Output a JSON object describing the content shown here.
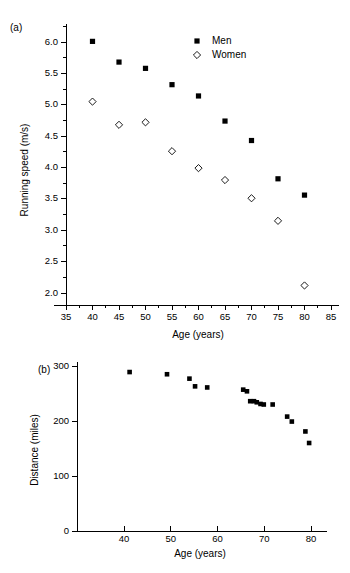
{
  "figure": {
    "panel_a_label": "(a)",
    "panel_b_label": "(b)"
  },
  "legend": {
    "men_label": "Men",
    "women_label": "Women"
  },
  "chart_data": [
    {
      "type": "scatter",
      "panel": "(a)",
      "title": "",
      "xlabel": "Age (years)",
      "ylabel": "Running speed (m/s)",
      "xlim": [
        35,
        85
      ],
      "ylim": [
        2.0,
        6.0
      ],
      "xticks": [
        35,
        40,
        45,
        50,
        55,
        60,
        65,
        70,
        75,
        80,
        85
      ],
      "yticks": [
        2.0,
        2.5,
        3.0,
        3.5,
        4.0,
        4.5,
        5.0,
        5.5,
        6.0
      ],
      "xtick_labels": [
        "35",
        "40",
        "45",
        "50",
        "55",
        "60",
        "65",
        "70",
        "75",
        "80",
        "85"
      ],
      "ytick_labels": [
        "2.0",
        "2.5",
        "3.0",
        "3.5",
        "4.0",
        "4.5",
        "5.0",
        "5.5",
        "6.0"
      ],
      "minor_ticks": true,
      "grid": false,
      "legend_position": "top-right",
      "series": [
        {
          "name": "Men",
          "marker": "filled-square",
          "x": [
            40,
            45,
            50,
            55,
            60,
            65,
            70,
            75,
            80
          ],
          "y": [
            6.01,
            5.68,
            5.58,
            5.32,
            5.14,
            4.74,
            4.43,
            3.82,
            3.56
          ]
        },
        {
          "name": "Women",
          "marker": "open-diamond",
          "x": [
            40,
            45,
            50,
            55,
            60,
            65,
            70,
            75,
            80
          ],
          "y": [
            5.05,
            4.68,
            4.72,
            4.26,
            3.99,
            3.8,
            3.51,
            3.15,
            2.12
          ]
        }
      ]
    },
    {
      "type": "scatter",
      "panel": "(b)",
      "title": "",
      "xlabel": "Age (years)",
      "ylabel": "Distance (miles)",
      "xlim": [
        35,
        82
      ],
      "ylim": [
        0,
        300
      ],
      "xticks": [
        40,
        50,
        60,
        70,
        80
      ],
      "yticks": [
        0,
        100,
        200,
        300
      ],
      "xtick_labels": [
        "40",
        "50",
        "60",
        "70",
        "80"
      ],
      "ytick_labels": [
        "0",
        "100",
        "200",
        "300"
      ],
      "minor_ticks": false,
      "grid": false,
      "legend_position": "none",
      "series": [
        {
          "name": "Distance",
          "marker": "filled-square",
          "x": [
            41.2,
            49.2,
            54.0,
            55.2,
            57.8,
            65.5,
            66.3,
            67.0,
            67.8,
            68.4,
            69.2,
            69.9,
            71.8,
            74.9,
            75.9,
            78.8,
            79.6
          ],
          "y": [
            289,
            285,
            277,
            263,
            261,
            257,
            254,
            236,
            236,
            234,
            231,
            230,
            230,
            208,
            199,
            181,
            160
          ]
        }
      ]
    }
  ]
}
